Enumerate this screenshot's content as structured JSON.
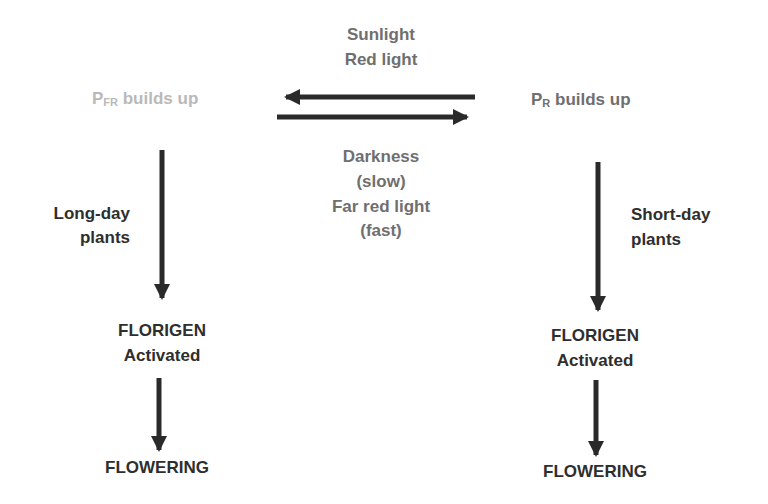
{
  "diagram": {
    "top_condition": {
      "line1": "Sunlight",
      "line2": "Red light"
    },
    "bottom_condition": {
      "line1": "Darkness",
      "line2": "(slow)",
      "line3": "Far red light",
      "line4": "(fast)"
    },
    "left_state": {
      "prefix": "P",
      "subscript": "FR",
      "suffix": " builds up"
    },
    "right_state": {
      "prefix": "P",
      "subscript": "R",
      "suffix": " builds up"
    },
    "left_branch": {
      "label_line1": "Long-day",
      "label_line2": "plants",
      "step1_line1": "FLORIGEN",
      "step1_line2": "Activated",
      "result": "FLOWERING"
    },
    "right_branch": {
      "label_line1": "Short-day",
      "label_line2": "plants",
      "step1_line1": "FLORIGEN",
      "step1_line2": "Activated",
      "result": "FLOWERING"
    },
    "colors": {
      "dark_text": "#2e2e2e",
      "mid_text": "#6f6f6f",
      "light_text": "#b9b9b9",
      "arrow": "#2a2a2a"
    }
  }
}
